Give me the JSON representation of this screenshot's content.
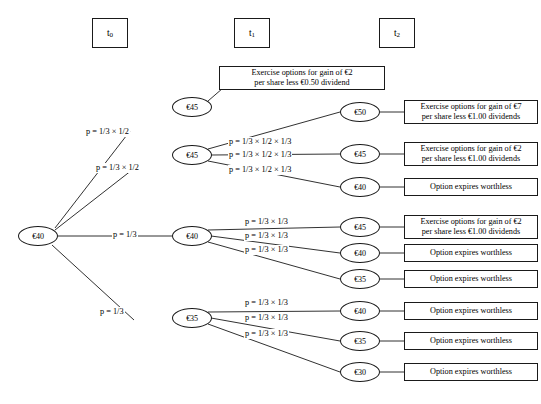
{
  "diagram": {
    "width": 541,
    "height": 404,
    "line_color": "#1a1a1a",
    "background": "#ffffff"
  },
  "periods": [
    {
      "label": "t",
      "sub": "0",
      "x": 92,
      "y": 18,
      "w": 36,
      "h": 30
    },
    {
      "label": "t",
      "sub": "1",
      "x": 234,
      "y": 18,
      "w": 36,
      "h": 30
    },
    {
      "label": "t",
      "sub": "2",
      "x": 379,
      "y": 18,
      "w": 36,
      "h": 30
    }
  ],
  "nodes": [
    {
      "id": "root",
      "label": "€40",
      "cx": 38,
      "cy": 236,
      "rx": 20,
      "ry": 10
    },
    {
      "id": "t1a",
      "label": "€45",
      "cx": 192,
      "cy": 107,
      "rx": 20,
      "ry": 10
    },
    {
      "id": "t1b",
      "label": "€45",
      "cx": 192,
      "cy": 155,
      "rx": 20,
      "ry": 10
    },
    {
      "id": "t1c",
      "label": "€40",
      "cx": 192,
      "cy": 236,
      "rx": 20,
      "ry": 10
    },
    {
      "id": "t1d",
      "label": "€35",
      "cx": 192,
      "cy": 318,
      "rx": 20,
      "ry": 10
    },
    {
      "id": "t2a",
      "label": "€50",
      "cx": 360,
      "cy": 112,
      "rx": 20,
      "ry": 10
    },
    {
      "id": "t2b",
      "label": "€45",
      "cx": 360,
      "cy": 154,
      "rx": 20,
      "ry": 10
    },
    {
      "id": "t2c",
      "label": "€40",
      "cx": 360,
      "cy": 187,
      "rx": 20,
      "ry": 10
    },
    {
      "id": "t2d",
      "label": "€45",
      "cx": 360,
      "cy": 227,
      "rx": 20,
      "ry": 10
    },
    {
      "id": "t2e",
      "label": "€40",
      "cx": 360,
      "cy": 253,
      "rx": 20,
      "ry": 10
    },
    {
      "id": "t2f",
      "label": "€35",
      "cx": 360,
      "cy": 279,
      "rx": 20,
      "ry": 10
    },
    {
      "id": "t2g",
      "label": "€40",
      "cx": 360,
      "cy": 311,
      "rx": 20,
      "ry": 10
    },
    {
      "id": "t2h",
      "label": "€35",
      "cx": 360,
      "cy": 341,
      "rx": 20,
      "ry": 10
    },
    {
      "id": "t2i",
      "label": "€30",
      "cx": 360,
      "cy": 372,
      "rx": 20,
      "ry": 10
    }
  ],
  "edges": [
    {
      "from": "root",
      "to": "t1a",
      "x1": 55,
      "y1": 228,
      "x2": 130,
      "y2": 131
    },
    {
      "from": "root",
      "to": "t1b",
      "x1": 55,
      "y1": 230,
      "x2": 132,
      "y2": 170
    },
    {
      "from": "root",
      "to": "t1c",
      "x1": 58,
      "y1": 236,
      "x2": 172,
      "y2": 236
    },
    {
      "from": "root",
      "to": "t1d",
      "x1": 52,
      "y1": 245,
      "x2": 134,
      "y2": 320
    },
    {
      "from": "t1a",
      "to": "box1",
      "x1": 208,
      "y1": 101,
      "x2": 230,
      "y2": 82
    },
    {
      "from": "t1b",
      "to": "t2a",
      "x1": 208,
      "y1": 149,
      "x2": 340,
      "y2": 112
    },
    {
      "from": "t1b",
      "to": "t2b",
      "x1": 211,
      "y1": 155,
      "x2": 340,
      "y2": 154
    },
    {
      "from": "t1b",
      "to": "t2c",
      "x1": 208,
      "y1": 161,
      "x2": 340,
      "y2": 187
    },
    {
      "from": "t1c",
      "to": "t2d",
      "x1": 208,
      "y1": 230,
      "x2": 340,
      "y2": 227
    },
    {
      "from": "t1c",
      "to": "t2e",
      "x1": 211,
      "y1": 236,
      "x2": 340,
      "y2": 253
    },
    {
      "from": "t1c",
      "to": "t2f",
      "x1": 208,
      "y1": 242,
      "x2": 340,
      "y2": 279
    },
    {
      "from": "t1d",
      "to": "t2g",
      "x1": 208,
      "y1": 312,
      "x2": 340,
      "y2": 311
    },
    {
      "from": "t1d",
      "to": "t2h",
      "x1": 211,
      "y1": 318,
      "x2": 340,
      "y2": 341
    },
    {
      "from": "t1d",
      "to": "t2i",
      "x1": 208,
      "y1": 324,
      "x2": 340,
      "y2": 372
    },
    {
      "from": "t2a",
      "to": "box2",
      "x1": 380,
      "y1": 112,
      "x2": 404,
      "y2": 112
    },
    {
      "from": "t2b",
      "to": "box3",
      "x1": 380,
      "y1": 154,
      "x2": 404,
      "y2": 154
    },
    {
      "from": "t2c",
      "to": "box4",
      "x1": 380,
      "y1": 187,
      "x2": 404,
      "y2": 187
    },
    {
      "from": "t2d",
      "to": "box5",
      "x1": 380,
      "y1": 227,
      "x2": 404,
      "y2": 227
    },
    {
      "from": "t2e",
      "to": "box6",
      "x1": 380,
      "y1": 253,
      "x2": 404,
      "y2": 253
    },
    {
      "from": "t2f",
      "to": "box7",
      "x1": 380,
      "y1": 279,
      "x2": 404,
      "y2": 279
    },
    {
      "from": "t2g",
      "to": "box8",
      "x1": 380,
      "y1": 311,
      "x2": 404,
      "y2": 311
    },
    {
      "from": "t2h",
      "to": "box9",
      "x1": 380,
      "y1": 341,
      "x2": 404,
      "y2": 341
    },
    {
      "from": "t2i",
      "to": "box10",
      "x1": 380,
      "y1": 372,
      "x2": 404,
      "y2": 372
    }
  ],
  "probabilities": [
    {
      "id": "p1",
      "text": "p = 1/3 × 1/2",
      "x": 85,
      "y": 127
    },
    {
      "id": "p2",
      "text": "p = 1/3 × 1/2",
      "x": 95,
      "y": 163
    },
    {
      "id": "p3",
      "text": "p = 1/3",
      "x": 112,
      "y": 230
    },
    {
      "id": "p4",
      "text": "p = 1/3",
      "x": 99,
      "y": 307
    },
    {
      "id": "p5",
      "text": "p = 1/3 × 1/2 × 1/3",
      "x": 228,
      "y": 137
    },
    {
      "id": "p6",
      "text": "p = 1/3 × 1/2 × 1/3",
      "x": 228,
      "y": 150
    },
    {
      "id": "p7",
      "text": "p = 1/3 × 1/2 × 1/3",
      "x": 228,
      "y": 165
    },
    {
      "id": "p8",
      "text": "p = 1/3 × 1/3",
      "x": 244,
      "y": 217
    },
    {
      "id": "p9",
      "text": "p = 1/3 × 1/3",
      "x": 244,
      "y": 231
    },
    {
      "id": "p10",
      "text": "p = 1/3 × 1/3",
      "x": 244,
      "y": 245
    },
    {
      "id": "p11",
      "text": "p = 1/3 × 1/3",
      "x": 244,
      "y": 298
    },
    {
      "id": "p12",
      "text": "p = 1/3 × 1/3",
      "x": 244,
      "y": 313
    },
    {
      "id": "p13",
      "text": "p = 1/3 × 1/3",
      "x": 244,
      "y": 329
    }
  ],
  "outcomes": [
    {
      "id": "box1",
      "lines": [
        "Exercise options for gain of €2",
        "per share less €0.50 dividend"
      ],
      "x": 219,
      "y": 66,
      "w": 166,
      "h": 24
    },
    {
      "id": "box2",
      "lines": [
        "Exercise options for gain of €7",
        "per share less €1.00 dividends"
      ],
      "x": 404,
      "y": 100,
      "w": 134,
      "h": 24
    },
    {
      "id": "box3",
      "lines": [
        "Exercise options for gain of €2",
        "per share less €1.00 dividends"
      ],
      "x": 404,
      "y": 142,
      "w": 134,
      "h": 24
    },
    {
      "id": "box4",
      "lines": [
        "Option expires worthless"
      ],
      "x": 404,
      "y": 178,
      "w": 134,
      "h": 18
    },
    {
      "id": "box5",
      "lines": [
        "Exercise options for gain of €2",
        "per share less €1.00 dividends"
      ],
      "x": 404,
      "y": 215,
      "w": 134,
      "h": 24
    },
    {
      "id": "box6",
      "lines": [
        "Option expires worthless"
      ],
      "x": 404,
      "y": 244,
      "w": 134,
      "h": 18
    },
    {
      "id": "box7",
      "lines": [
        "Option expires worthless"
      ],
      "x": 404,
      "y": 270,
      "w": 134,
      "h": 18
    },
    {
      "id": "box8",
      "lines": [
        "Option expires worthless"
      ],
      "x": 404,
      "y": 302,
      "w": 134,
      "h": 18
    },
    {
      "id": "box9",
      "lines": [
        "Option expires worthless"
      ],
      "x": 404,
      "y": 332,
      "w": 134,
      "h": 18
    },
    {
      "id": "box10",
      "lines": [
        "Option expires worthless"
      ],
      "x": 404,
      "y": 363,
      "w": 134,
      "h": 18
    }
  ]
}
